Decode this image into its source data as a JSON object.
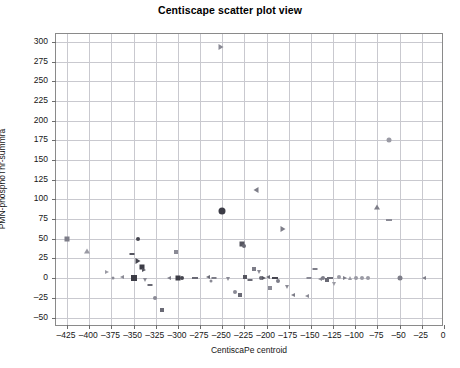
{
  "chart_data": {
    "type": "scatter",
    "title": "Centiscape scatter plot view",
    "xlabel": "CentiscaPe centroid",
    "ylabel": "PMN-phosphoThr-summra",
    "xlim": [
      -437.5,
      0
    ],
    "ylim": [
      -62,
      310
    ],
    "grid": true,
    "legend": "none",
    "xticks": [
      -425,
      -400,
      -375,
      -350,
      -325,
      -300,
      -275,
      -250,
      -225,
      -200,
      -175,
      -150,
      -125,
      -100,
      -75,
      -50,
      -25,
      0
    ],
    "yticks": [
      300,
      275,
      250,
      225,
      200,
      175,
      150,
      125,
      100,
      75,
      50,
      25,
      0,
      -25,
      -50
    ],
    "marker_colors": {
      "dark": "#3c3c46",
      "mid": "#7d7d88",
      "light": "#a9a9b4"
    },
    "points": [
      {
        "x": -252,
        "y": 293,
        "shape": "rtri",
        "size": 5,
        "color": "#8a8a95"
      },
      {
        "x": -62,
        "y": 176,
        "shape": "circle",
        "size": 5,
        "color": "#9a9aa4"
      },
      {
        "x": -212,
        "y": 112,
        "shape": "ltri",
        "size": 5,
        "color": "#7d7d88"
      },
      {
        "x": -75,
        "y": 90,
        "shape": "tri",
        "size": 5,
        "color": "#7d7d88"
      },
      {
        "x": -250,
        "y": 85,
        "shape": "circle",
        "size": 7,
        "color": "#3c3c46"
      },
      {
        "x": -62,
        "y": 74,
        "shape": "dash",
        "size": 5,
        "color": "#8a8a95"
      },
      {
        "x": -182,
        "y": 62,
        "shape": "rtri",
        "size": 5,
        "color": "#7d7d88"
      },
      {
        "x": -425,
        "y": 50,
        "shape": "square",
        "size": 5,
        "color": "#7d7d88"
      },
      {
        "x": -345,
        "y": 50,
        "shape": "circle",
        "size": 4,
        "color": "#45454f"
      },
      {
        "x": -228,
        "y": 43,
        "shape": "square",
        "size": 5,
        "color": "#55555f"
      },
      {
        "x": -225,
        "y": 41,
        "shape": "circle",
        "size": 4,
        "color": "#6a6a75"
      },
      {
        "x": -402,
        "y": 35,
        "shape": "tri",
        "size": 5,
        "color": "#9a9aa4"
      },
      {
        "x": -302,
        "y": 33,
        "shape": "square",
        "size": 4,
        "color": "#8a8a95"
      },
      {
        "x": -352,
        "y": 31,
        "shape": "dash",
        "size": 4,
        "color": "#55555f"
      },
      {
        "x": -345,
        "y": 22,
        "shape": "rtri",
        "size": 5,
        "color": "#45454f"
      },
      {
        "x": -340,
        "y": 14,
        "shape": "square",
        "size": 5,
        "color": "#3c3c46"
      },
      {
        "x": -338,
        "y": 11,
        "shape": "rtri",
        "size": 4,
        "color": "#55555f"
      },
      {
        "x": -380,
        "y": 8,
        "shape": "rtri",
        "size": 4,
        "color": "#9a9aa4"
      },
      {
        "x": -363,
        "y": 2,
        "shape": "ltri",
        "size": 4,
        "color": "#8a8a95"
      },
      {
        "x": -349,
        "y": 0,
        "shape": "square",
        "size": 6,
        "color": "#3c3c46"
      },
      {
        "x": -337,
        "y": -2,
        "shape": "tri-down",
        "size": 4,
        "color": "#8a8a95"
      },
      {
        "x": -331,
        "y": -9,
        "shape": "dash",
        "size": 4,
        "color": "#6a6a75"
      },
      {
        "x": -326,
        "y": -25,
        "shape": "circle",
        "size": 4,
        "color": "#8a8a95"
      },
      {
        "x": -318,
        "y": -41,
        "shape": "square",
        "size": 4,
        "color": "#6a6a75"
      },
      {
        "x": -300,
        "y": 0,
        "shape": "square",
        "size": 5,
        "color": "#3c3c46"
      },
      {
        "x": -295,
        "y": 0,
        "shape": "circle",
        "size": 4,
        "color": "#45454f"
      },
      {
        "x": -281,
        "y": 0,
        "shape": "dash",
        "size": 5,
        "color": "#6a6a75"
      },
      {
        "x": -266,
        "y": 2,
        "shape": "ltri",
        "size": 4,
        "color": "#6a6a75"
      },
      {
        "x": -263,
        "y": -3,
        "shape": "circle",
        "size": 3,
        "color": "#8a8a95"
      },
      {
        "x": -259,
        "y": 0,
        "shape": "dash",
        "size": 4,
        "color": "#7d7d88"
      },
      {
        "x": -244,
        "y": -1,
        "shape": "tri-down",
        "size": 4,
        "color": "#8a8a95"
      },
      {
        "x": -236,
        "y": -17,
        "shape": "circle",
        "size": 4,
        "color": "#8a8a95"
      },
      {
        "x": -230,
        "y": -22,
        "shape": "square",
        "size": 4,
        "color": "#6a6a75"
      },
      {
        "x": -224,
        "y": 1,
        "shape": "square",
        "size": 4,
        "color": "#55555f"
      },
      {
        "x": -219,
        "y": -2,
        "shape": "dash",
        "size": 4,
        "color": "#6a6a75"
      },
      {
        "x": -214,
        "y": 12,
        "shape": "square",
        "size": 4,
        "color": "#7d7d88"
      },
      {
        "x": -209,
        "y": 8,
        "shape": "tri-down",
        "size": 4,
        "color": "#8a8a95"
      },
      {
        "x": -206,
        "y": 0,
        "shape": "circle",
        "size": 4,
        "color": "#6a6a75"
      },
      {
        "x": -203,
        "y": 0,
        "shape": "rtri",
        "size": 4,
        "color": "#55555f"
      },
      {
        "x": -199,
        "y": 1,
        "shape": "ltri",
        "size": 4,
        "color": "#6a6a75"
      },
      {
        "x": -196,
        "y": -12,
        "shape": "square",
        "size": 4,
        "color": "#8a8a95"
      },
      {
        "x": -191,
        "y": 0,
        "shape": "dash",
        "size": 5,
        "color": "#45454f"
      },
      {
        "x": -187,
        "y": -4,
        "shape": "circle",
        "size": 4,
        "color": "#7d7d88"
      },
      {
        "x": -177,
        "y": -11,
        "shape": "tri-down",
        "size": 4,
        "color": "#8a8a95"
      },
      {
        "x": -170,
        "y": -21,
        "shape": "ltri",
        "size": 4,
        "color": "#7d7d88"
      },
      {
        "x": -155,
        "y": -23,
        "shape": "ltri",
        "size": 4,
        "color": "#8a8a95"
      },
      {
        "x": -152,
        "y": 0,
        "shape": "dash",
        "size": 4,
        "color": "#8a8a95"
      },
      {
        "x": -145,
        "y": 12,
        "shape": "dash",
        "size": 4,
        "color": "#7d7d88"
      },
      {
        "x": -140,
        "y": -1,
        "shape": "ltri",
        "size": 4,
        "color": "#8a8a95"
      },
      {
        "x": -136,
        "y": 0,
        "shape": "circle",
        "size": 4,
        "color": "#7d7d88"
      },
      {
        "x": -132,
        "y": -2,
        "shape": "square",
        "size": 4,
        "color": "#6a6a75"
      },
      {
        "x": -128,
        "y": 0,
        "shape": "dash",
        "size": 5,
        "color": "#6a6a75"
      },
      {
        "x": -124,
        "y": -8,
        "shape": "tri-down",
        "size": 4,
        "color": "#9a9aa4"
      },
      {
        "x": -118,
        "y": 1,
        "shape": "circle",
        "size": 4,
        "color": "#9a9aa4"
      },
      {
        "x": -112,
        "y": 0,
        "shape": "rtri",
        "size": 4,
        "color": "#7d7d88"
      },
      {
        "x": -106,
        "y": 0,
        "shape": "tri",
        "size": 4,
        "color": "#9a9aa4"
      },
      {
        "x": -99,
        "y": 0,
        "shape": "circle",
        "size": 4,
        "color": "#9a9aa4"
      },
      {
        "x": -92,
        "y": 0,
        "shape": "circle",
        "size": 4,
        "color": "#9a9aa4"
      },
      {
        "x": -86,
        "y": 0,
        "shape": "circle",
        "size": 4,
        "color": "#9a9aa4"
      },
      {
        "x": -50,
        "y": 0,
        "shape": "circle",
        "size": 5,
        "color": "#7d7d88"
      },
      {
        "x": -22,
        "y": 0,
        "shape": "ltri",
        "size": 4,
        "color": "#7d7d88"
      },
      {
        "x": -310,
        "y": 0,
        "shape": "ltri",
        "size": 4,
        "color": "#7d7d88"
      },
      {
        "x": -373,
        "y": 0,
        "shape": "circle",
        "size": 3,
        "color": "#8a8a95"
      }
    ]
  }
}
